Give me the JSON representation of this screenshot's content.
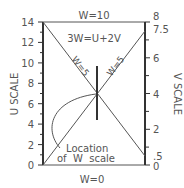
{
  "diagram": {
    "type": "nomogram",
    "equation": "3W=U+2V",
    "top_label": "W=10",
    "bottom_label": "W=0",
    "diag_label_left": "W=5",
    "diag_label_right": "W=5",
    "location_label_line1": "Location",
    "location_label_line2": "of  W  scale",
    "left_axis": {
      "title": "U SCALE",
      "min": 0,
      "max": 14,
      "tick_labels": [
        "14",
        "12",
        "10",
        "8",
        "6",
        "4",
        "2",
        "0"
      ]
    },
    "right_axis": {
      "title": "V SCALE",
      "min": 0,
      "max": 8,
      "tick_labels": [
        "8",
        "7.5",
        "6",
        "4",
        "2",
        ".5",
        "0"
      ]
    },
    "colors": {
      "line": "#555555",
      "axis": "#333333"
    }
  }
}
